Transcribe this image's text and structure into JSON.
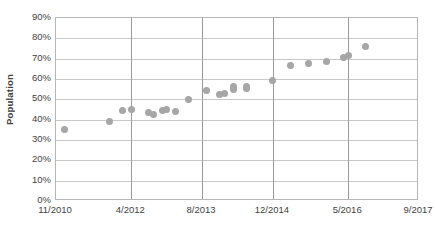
{
  "chart_data": {
    "type": "scatter",
    "title": "",
    "xlabel": "",
    "ylabel": "Population",
    "ylim": [
      0,
      0.9
    ],
    "grid": true,
    "legend": false,
    "y_tick_labels": [
      "90%",
      "80%",
      "70%",
      "60%",
      "50%",
      "40%",
      "30%",
      "20%",
      "10%",
      "0%"
    ],
    "y_tick_values": [
      0.9,
      0.8,
      0.7,
      0.6,
      0.5,
      0.4,
      0.3,
      0.2,
      0.1,
      0.0
    ],
    "x_tick_labels": [
      "11/2010",
      "4/2012",
      "8/2013",
      "12/2014",
      "5/2016",
      "9/2017"
    ],
    "point_color": "#a6a6a6",
    "points": [
      {
        "x": "1/2011",
        "y": 0.35
      },
      {
        "x": "11/2011",
        "y": 0.39
      },
      {
        "x": "2/2012",
        "y": 0.445
      },
      {
        "x": "4/2012",
        "y": 0.45
      },
      {
        "x": "8/2012",
        "y": 0.435
      },
      {
        "x": "9/2012",
        "y": 0.425
      },
      {
        "x": "11/2012",
        "y": 0.445
      },
      {
        "x": "12/2012",
        "y": 0.45
      },
      {
        "x": "2/2013",
        "y": 0.44
      },
      {
        "x": "5/2013",
        "y": 0.5
      },
      {
        "x": "9/2013",
        "y": 0.545
      },
      {
        "x": "12/2013",
        "y": 0.525
      },
      {
        "x": "1/2014",
        "y": 0.53
      },
      {
        "x": "3/2014",
        "y": 0.55
      },
      {
        "x": "3/2014b",
        "y": 0.565
      },
      {
        "x": "6/2014",
        "y": 0.555
      },
      {
        "x": "6/2014b",
        "y": 0.565
      },
      {
        "x": "12/2014",
        "y": 0.595
      },
      {
        "x": "4/2015",
        "y": 0.665
      },
      {
        "x": "8/2015",
        "y": 0.675
      },
      {
        "x": "12/2015",
        "y": 0.685
      },
      {
        "x": "4/2016",
        "y": 0.705
      },
      {
        "x": "5/2016",
        "y": 0.715
      },
      {
        "x": "9/2016",
        "y": 0.76
      }
    ]
  },
  "axis": {
    "y_title": "Population"
  }
}
